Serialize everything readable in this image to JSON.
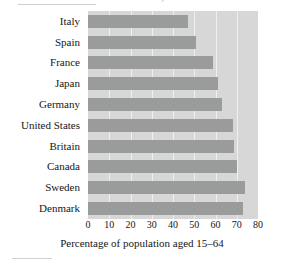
{
  "chart_data": {
    "type": "bar",
    "orientation": "horizontal",
    "title": "Workers Wealth, 2004",
    "categories": [
      "Italy",
      "Spain",
      "France",
      "Japan",
      "Germany",
      "United States",
      "Britain",
      "Canada",
      "Sweden",
      "Denmark"
    ],
    "values": [
      47,
      51,
      59,
      61,
      63,
      68,
      68.5,
      70,
      74,
      73
    ],
    "xlabel": "Percentage of population aged 15–64",
    "ylabel": "",
    "xticks": [
      "0",
      "10",
      "20",
      "30",
      "40",
      "50",
      "60",
      "70",
      "80"
    ],
    "xtick_values": [
      0,
      10,
      20,
      30,
      40,
      50,
      60,
      70,
      80
    ],
    "xlim": [
      0,
      80
    ],
    "grid": true,
    "legend": false,
    "colors": {
      "bar": "#9a9b9b",
      "plot_background": "#d7d7d7",
      "gridline": "#efefef",
      "text": "#161616",
      "page_background": "#ffffff"
    }
  }
}
